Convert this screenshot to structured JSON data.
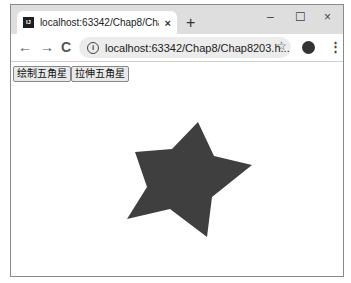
{
  "browser": {
    "tab": {
      "title": "localhost:63342/Chap8/Chap8",
      "favicon_label": "IJ",
      "close_icon": "×"
    },
    "new_tab_icon": "+",
    "window_controls": {
      "minimize": "–",
      "maximize": "☐",
      "close": "×"
    },
    "nav": {
      "back": "←",
      "forward": "→",
      "reload": "C"
    },
    "address": {
      "info_icon": "i",
      "url": "localhost:63342/Chap8/Chap8203.h..."
    },
    "bookmark_icon": "☆",
    "menu_icon": "⋮"
  },
  "page": {
    "buttons": [
      {
        "label": "绘制五角星"
      },
      {
        "label": "拉伸五角星"
      }
    ],
    "star": {
      "fill": "#3f3f3f",
      "points": "198,122 214,156 252,165 212,197 207,237 170,209 127,219 147,187 135,152 172,149"
    }
  }
}
